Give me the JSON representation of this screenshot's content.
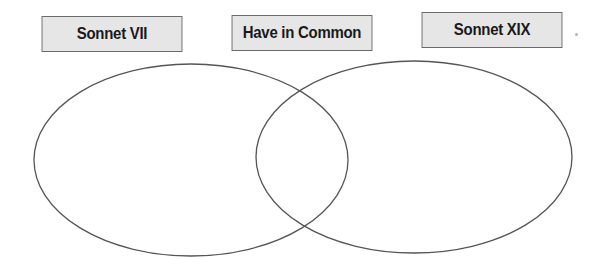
{
  "diagram": {
    "type": "venn",
    "labels": {
      "left": "Sonnet VII",
      "middle": "Have in Common",
      "right": "Sonnet XIX"
    },
    "colors": {
      "label_fill": "#e6e6e6",
      "label_border": "#6a6a6a",
      "ellipse_stroke": "#555555",
      "background": "#ffffff"
    }
  }
}
